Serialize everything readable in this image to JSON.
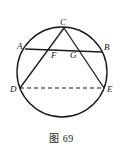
{
  "figure": {
    "caption": "图 69",
    "background_color": "#ffffff",
    "stroke_color": "#1a1a1a",
    "labels": {
      "A": "A",
      "B": "B",
      "C": "C",
      "D": "D",
      "E": "E",
      "F": "F",
      "G": "G"
    },
    "geometry": {
      "circle": {
        "cx": 62,
        "cy": 72,
        "r": 45
      },
      "points": {
        "A": {
          "x": 25,
          "y": 49
        },
        "B": {
          "x": 102,
          "y": 52
        },
        "C": {
          "x": 64,
          "y": 28
        },
        "D": {
          "x": 20,
          "y": 88
        },
        "E": {
          "x": 104,
          "y": 88
        },
        "F": {
          "x": 55,
          "y": 50
        },
        "G": {
          "x": 73,
          "y": 51
        }
      },
      "segments": [
        {
          "name": "chord-AB",
          "from": "A",
          "to": "B",
          "style": "solid"
        },
        {
          "name": "segment-CD",
          "from": "C",
          "to": "D",
          "style": "solid"
        },
        {
          "name": "segment-CE",
          "from": "C",
          "to": "E",
          "style": "solid"
        },
        {
          "name": "chord-DE",
          "from": "D",
          "to": "E",
          "style": "dashed"
        }
      ]
    },
    "label_positions": {
      "A": {
        "x": 17,
        "y": 49
      },
      "B": {
        "x": 104,
        "y": 50
      },
      "C": {
        "x": 60,
        "y": 25
      },
      "D": {
        "x": 10,
        "y": 92
      },
      "E": {
        "x": 107,
        "y": 92
      },
      "F": {
        "x": 51,
        "y": 58
      },
      "G": {
        "x": 70,
        "y": 58
      }
    }
  }
}
